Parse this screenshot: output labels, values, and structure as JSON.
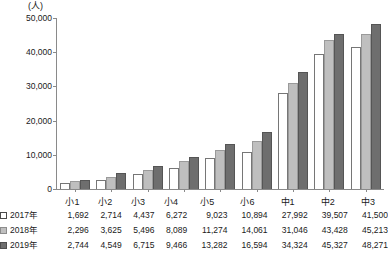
{
  "chart_data": {
    "type": "bar",
    "title": "",
    "unit_label": "(人)",
    "xlabel": "",
    "ylabel": "",
    "ylim": [
      0,
      50000
    ],
    "yticks": [
      0,
      10000,
      20000,
      30000,
      40000,
      50000
    ],
    "ytick_labels": [
      "0",
      "10,000",
      "20,000",
      "30,000",
      "40,000",
      "50,000"
    ],
    "grid": false,
    "legend_position": "bottom-left",
    "categories": [
      "小1",
      "小2",
      "小3",
      "小4",
      "小5",
      "小6",
      "中1",
      "中2",
      "中3"
    ],
    "series": [
      {
        "name": "2017年",
        "color": "#ffffff",
        "values": [
          1692,
          2714,
          4437,
          6272,
          9023,
          10894,
          27992,
          39507,
          41500
        ],
        "labels": [
          "1,692",
          "2,714",
          "4,437",
          "6,272",
          "9,023",
          "10,894",
          "27,992",
          "39,507",
          "41,500"
        ]
      },
      {
        "name": "2018年",
        "color": "#bfbfbf",
        "values": [
          2296,
          3625,
          5496,
          8089,
          11274,
          14061,
          31046,
          43428,
          45213
        ],
        "labels": [
          "2,296",
          "3,625",
          "5,496",
          "8,089",
          "11,274",
          "14,061",
          "31,046",
          "43,428",
          "45,213"
        ]
      },
      {
        "name": "2019年",
        "color": "#6e6e6e",
        "values": [
          2744,
          4549,
          6715,
          9466,
          13282,
          16594,
          34324,
          45327,
          48271
        ],
        "labels": [
          "2,744",
          "4,549",
          "6,715",
          "9,466",
          "13,282",
          "16,594",
          "34,324",
          "45,327",
          "48,271"
        ]
      }
    ]
  }
}
